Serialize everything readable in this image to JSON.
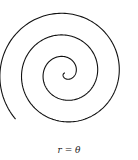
{
  "chart_data": {
    "type": "line",
    "title": "",
    "equation": "r = θ",
    "curve": "archimedean-spiral",
    "theta_range_radians": [
      0,
      19.6
    ],
    "line_color": "#111111",
    "xlabel": "",
    "ylabel": "",
    "grid": false,
    "axes": false
  },
  "caption": "r = θ"
}
